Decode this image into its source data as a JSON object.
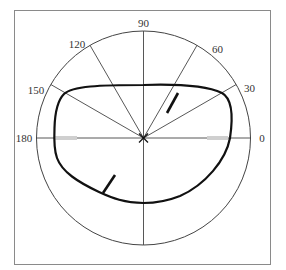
{
  "diagram": {
    "type": "polar-plot",
    "angle_labels": [
      {
        "angle": 0,
        "text": "0",
        "x": 262,
        "y": 142,
        "anchor": "middle"
      },
      {
        "angle": 30,
        "text": "30",
        "x": 245,
        "y": 92,
        "anchor": "start"
      },
      {
        "angle": 60,
        "text": "60",
        "x": 212,
        "y": 53,
        "anchor": "start"
      },
      {
        "angle": 90,
        "text": "90",
        "x": 143,
        "y": 28,
        "anchor": "middle"
      },
      {
        "angle": 120,
        "text": "120",
        "x": 77,
        "y": 48,
        "anchor": "middle"
      },
      {
        "angle": 150,
        "text": "150",
        "x": 36,
        "y": 93,
        "anchor": "middle"
      },
      {
        "angle": 180,
        "text": "180",
        "x": 26,
        "y": 142,
        "anchor": "middle"
      }
    ],
    "colors": {
      "frame": "#8a8a8a",
      "grid": "#444444",
      "curve": "#111111",
      "highlight": "#cfcfcf"
    }
  }
}
